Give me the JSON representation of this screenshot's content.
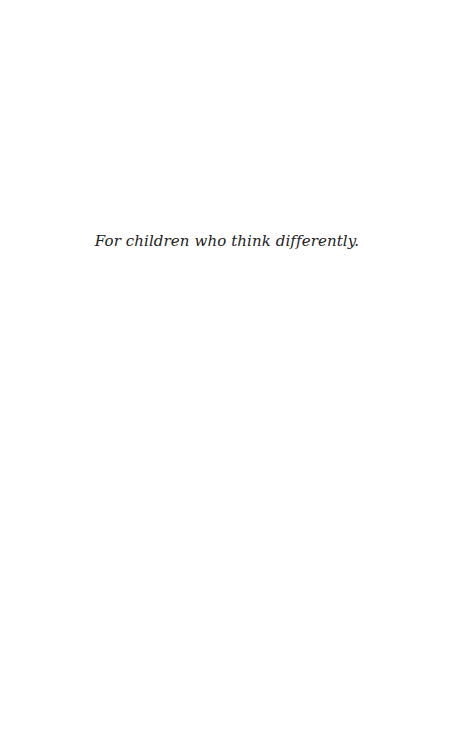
{
  "page": {
    "dedication": "For children who think differently."
  }
}
